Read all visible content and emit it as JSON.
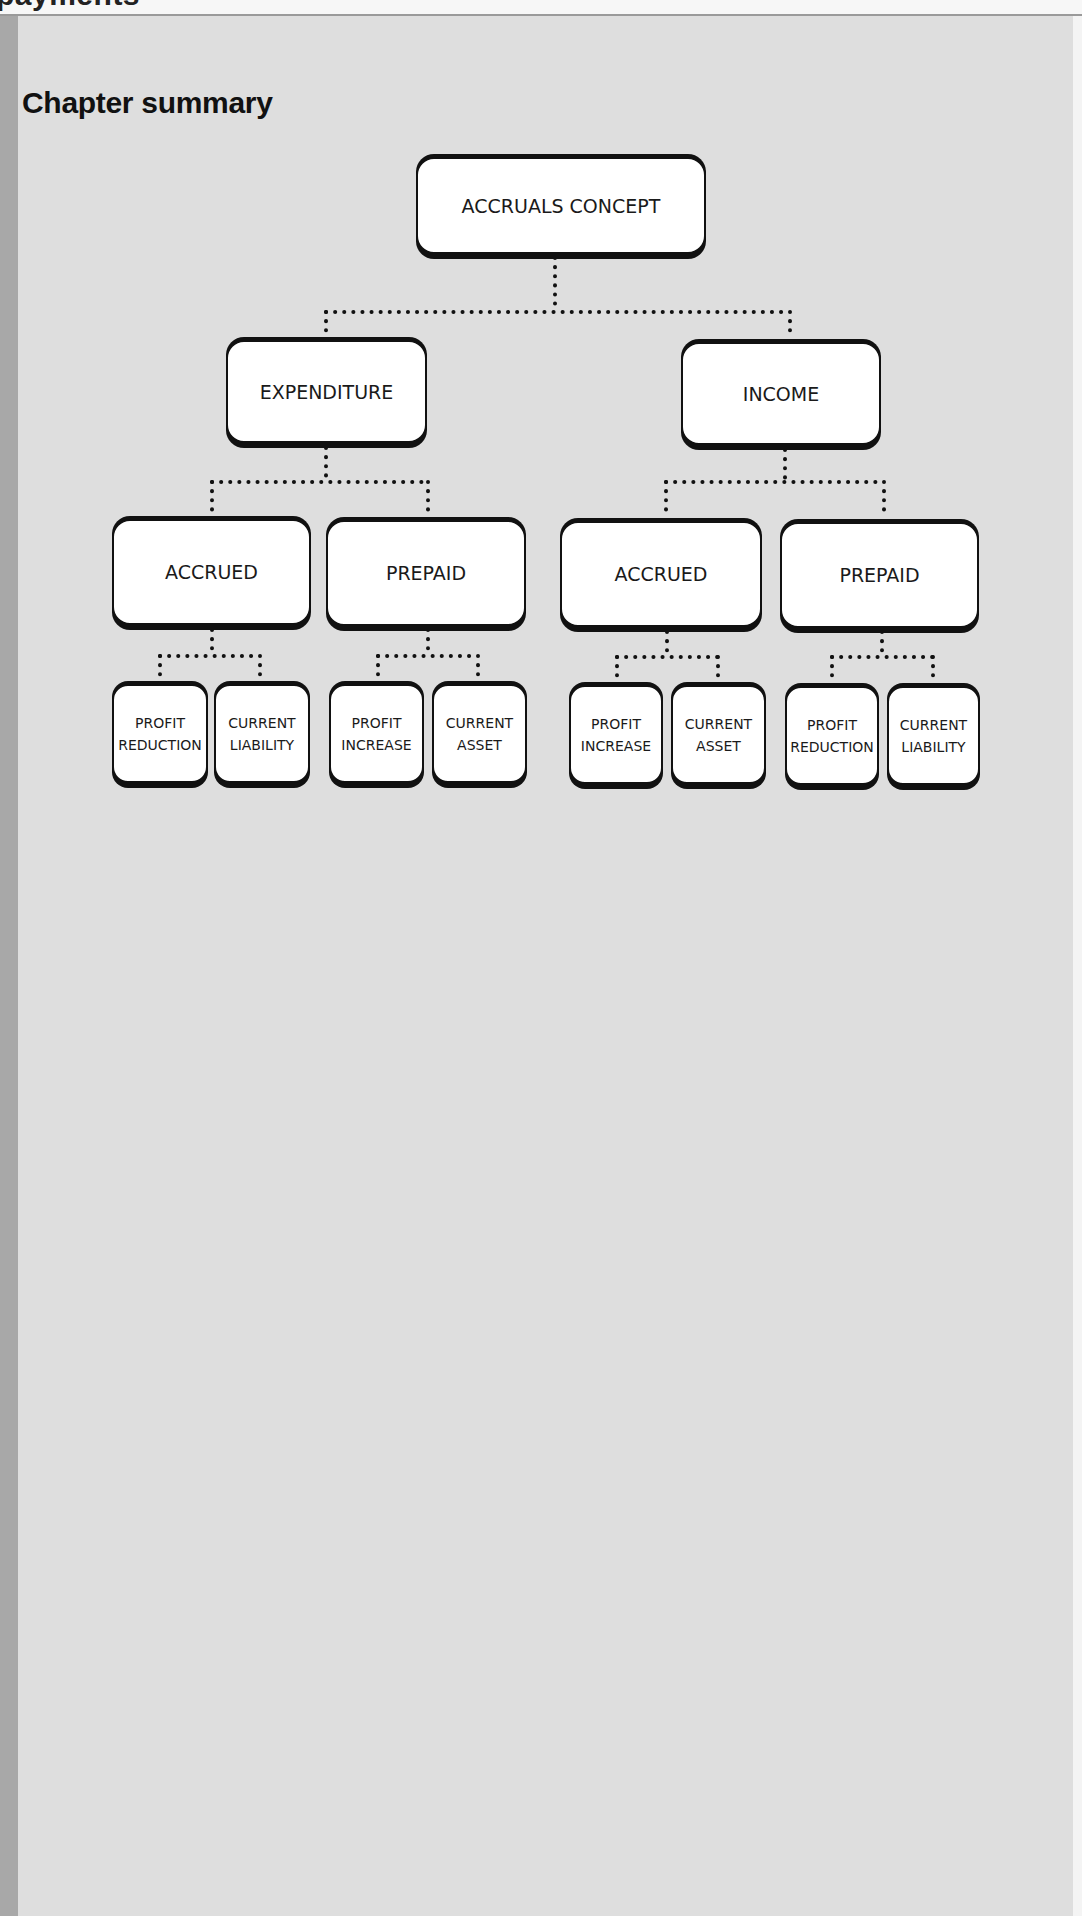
{
  "header": {
    "running_head": "payments"
  },
  "section": {
    "title": "Chapter summary"
  },
  "diagram": {
    "root": {
      "label": "ACCRUALS CONCEPT"
    },
    "branches": [
      {
        "label": "EXPENDITURE",
        "children": [
          {
            "label": "ACCRUED",
            "leaves": [
              {
                "line1": "PROFIT",
                "line2": "REDUCTION"
              },
              {
                "line1": "CURRENT",
                "line2": "LIABILITY"
              }
            ]
          },
          {
            "label": "PREPAID",
            "leaves": [
              {
                "line1": "PROFIT",
                "line2": "INCREASE"
              },
              {
                "line1": "CURRENT",
                "line2": "ASSET"
              }
            ]
          }
        ]
      },
      {
        "label": "INCOME",
        "children": [
          {
            "label": "ACCRUED",
            "leaves": [
              {
                "line1": "PROFIT",
                "line2": "INCREASE"
              },
              {
                "line1": "CURRENT",
                "line2": "ASSET"
              }
            ]
          },
          {
            "label": "PREPAID",
            "leaves": [
              {
                "line1": "PROFIT",
                "line2": "REDUCTION"
              },
              {
                "line1": "CURRENT",
                "line2": "LIABILITY"
              }
            ]
          }
        ]
      }
    ]
  },
  "colors": {
    "panel_bg": "#dedede",
    "left_bar": "#a8a8a8",
    "box_border": "#111111",
    "box_fill": "#ffffff"
  }
}
